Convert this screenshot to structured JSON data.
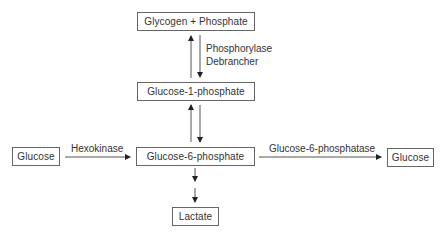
{
  "diagram": {
    "nodes": {
      "glycogen": "Glycogen + Phosphate",
      "g1p": "Glucose-1-phosphate",
      "g6p": "Glucose-6-phosphate",
      "glucose_in": "Glucose",
      "glucose_out": "Glucose",
      "lactate": "Lactate"
    },
    "edges": {
      "glycogen_g1p_enzymes": [
        "Phosphorylase",
        "Debrancher"
      ],
      "hexokinase": "Hexokinase",
      "g6pase": "Glucose-6-phosphatase"
    },
    "colors": {
      "stroke": "#666666",
      "arrow": "#222222",
      "text": "#333333"
    }
  }
}
